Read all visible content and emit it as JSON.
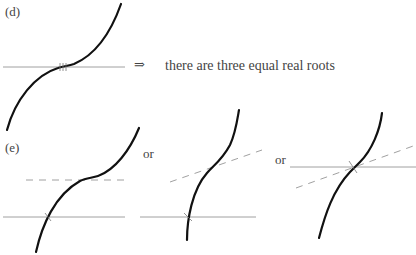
{
  "part_d": {
    "label": "(d)",
    "implies_symbol": "⇒",
    "conclusion": "there are three equal real roots"
  },
  "part_e": {
    "label": "(e)",
    "or_1": "or",
    "or_2": "or"
  }
}
